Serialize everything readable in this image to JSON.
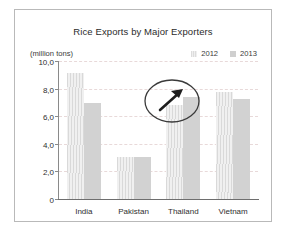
{
  "frame": {
    "border_color": "#b9b9b9"
  },
  "chart_data": {
    "type": "bar",
    "title": "Rice Exports by Major Exporters",
    "xlabel": "",
    "ylabel": "(million tons)",
    "unit_label": "(million tons)",
    "categories": [
      "India",
      "Pakistan",
      "Thailand",
      "Vietnam"
    ],
    "series": [
      {
        "name": "2012",
        "color": "#e2e2e2",
        "values": [
          9.2,
          3.1,
          6.9,
          7.8
        ]
      },
      {
        "name": "2013",
        "color": "#cfcfcf",
        "values": [
          7.0,
          3.1,
          7.5,
          7.3
        ]
      }
    ],
    "ylim": [
      0,
      10
    ],
    "yticks": [
      0,
      2,
      4,
      6,
      8,
      10
    ],
    "ytick_labels": [
      "0",
      "2,0",
      "4,0",
      "6,0",
      "8,0",
      "10,0"
    ],
    "grid": true,
    "grid_style": "dashed",
    "legend_position": "top-right",
    "annotations": [
      {
        "type": "ellipse-with-arrow",
        "target": "Thailand",
        "description": "circle highlighting Thailand bars with upward arrow"
      }
    ]
  }
}
